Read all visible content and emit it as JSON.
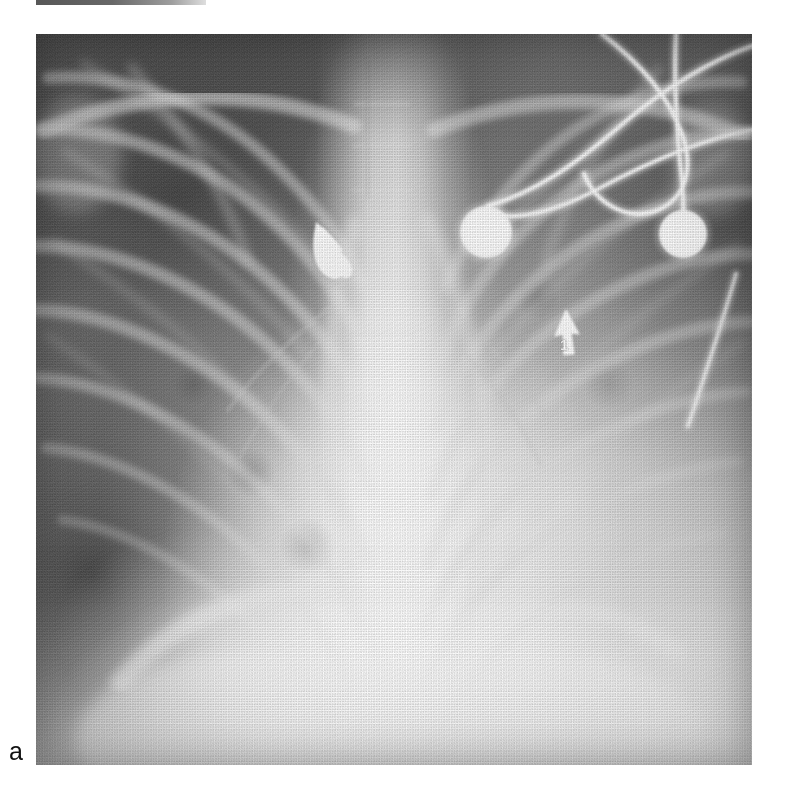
{
  "figure": {
    "label": "a",
    "modality": "chest-radiograph",
    "projection": "anteroposterior",
    "background_color": "#ffffff"
  },
  "radiograph": {
    "frame": {
      "x": 36,
      "y": 34,
      "width": 716,
      "height": 731
    },
    "tone": {
      "darkest": "#4a4a4a",
      "midtone": "#8a8a8a",
      "brightest": "#f2f2f2",
      "metal_white": "#ffffff"
    },
    "regions": [
      {
        "name": "right-lung-field",
        "side": "image-left",
        "appearance": "aerated-dark-with-rib-shadows"
      },
      {
        "name": "left-lung-field",
        "side": "image-right",
        "appearance": "opacified-hazy-consolidation"
      },
      {
        "name": "mediastinum-spine",
        "appearance": "bright-vertical-column"
      },
      {
        "name": "diaphragm-abdomen",
        "appearance": "bright-lower-band"
      }
    ]
  },
  "devices": {
    "electrodes": [
      {
        "name": "ecg-electrode-1",
        "cx": 450,
        "cy": 198,
        "r": 26
      },
      {
        "name": "ecg-electrode-2",
        "cx": 647,
        "cy": 200,
        "r": 24
      }
    ],
    "metal_marker": {
      "name": "radio-opaque-marker",
      "cx": 302,
      "cy": 219
    },
    "lead_wire_count": 5
  },
  "annotation": {
    "arrow": {
      "name": "annotation-arrow-1",
      "tip_x": 530,
      "tip_y": 278,
      "tail_x": 534,
      "tail_y": 318,
      "color": "#ffffff"
    },
    "number": {
      "text": "1",
      "x": 529,
      "y": 310,
      "color": "#ffffff"
    }
  }
}
